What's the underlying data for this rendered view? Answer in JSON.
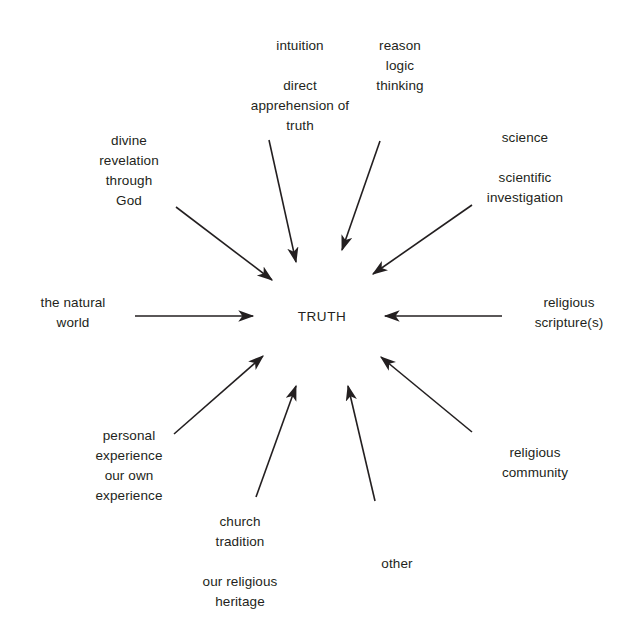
{
  "diagram": {
    "type": "radial-convergence",
    "title_visible": false,
    "center": {
      "label": "TRUTH",
      "x": 322,
      "y": 317
    },
    "background_color": "#ffffff",
    "line_color": "#231f20",
    "text_color": "#231f20",
    "nodes": [
      {
        "id": "intuition",
        "lines": [
          "intuition",
          "direct",
          "apprehension of",
          "truth"
        ],
        "text": "intuition\n\ndirect\napprehension of\ntruth",
        "align": "center",
        "x": 245,
        "y": 36,
        "width": 110,
        "arrow": {
          "x1": 269,
          "y1": 140,
          "x2": 296,
          "y2": 262
        }
      },
      {
        "id": "reason",
        "lines": [
          "reason",
          "logic",
          "thinking"
        ],
        "text": "reason\nlogic\nthinking",
        "align": "center",
        "x": 360,
        "y": 36,
        "width": 80,
        "arrow": {
          "x1": 380,
          "y1": 141,
          "x2": 342,
          "y2": 250
        }
      },
      {
        "id": "divine-revelation",
        "lines": [
          "divine",
          "revelation",
          "through",
          "God"
        ],
        "text": "divine\nrevelation\nthrough\nGod",
        "align": "center",
        "x": 80,
        "y": 131,
        "width": 98,
        "arrow": {
          "x1": 176,
          "y1": 207,
          "x2": 272,
          "y2": 280
        }
      },
      {
        "id": "science",
        "lines": [
          "science",
          "scientific",
          "investigation"
        ],
        "text": "science\n\nscientific\ninvestigation",
        "align": "center",
        "x": 470,
        "y": 128,
        "width": 110,
        "arrow": {
          "x1": 472,
          "y1": 205,
          "x2": 373,
          "y2": 274
        }
      },
      {
        "id": "natural-world",
        "lines": [
          "the natural",
          "world"
        ],
        "text": "the natural\nworld",
        "align": "center",
        "x": 23,
        "y": 293,
        "width": 100,
        "arrow": {
          "x1": 135,
          "y1": 316,
          "x2": 253,
          "y2": 316
        }
      },
      {
        "id": "religious-scriptures",
        "lines": [
          "religious",
          "scripture(s)"
        ],
        "text": "religious\nscripture(s)",
        "align": "center",
        "x": 519,
        "y": 293,
        "width": 100,
        "arrow": {
          "x1": 502,
          "y1": 316,
          "x2": 385,
          "y2": 316
        }
      },
      {
        "id": "personal-experience",
        "lines": [
          "personal",
          "experience",
          "our own",
          "experience"
        ],
        "text": "personal\nexperience\nour own\nexperience",
        "align": "center",
        "x": 74,
        "y": 426,
        "width": 110,
        "arrow": {
          "x1": 174,
          "y1": 434,
          "x2": 263,
          "y2": 356
        }
      },
      {
        "id": "religious-community",
        "lines": [
          "religious",
          "community"
        ],
        "text": "religious\ncommunity",
        "align": "center",
        "x": 480,
        "y": 443,
        "width": 110,
        "arrow": {
          "x1": 472,
          "y1": 432,
          "x2": 381,
          "y2": 357
        }
      },
      {
        "id": "church-tradition",
        "lines": [
          "church",
          "tradition",
          "our religious",
          "heritage"
        ],
        "text": "church\ntradition\n\nour religious\nheritage",
        "align": "center",
        "x": 180,
        "y": 512,
        "width": 120,
        "arrow": {
          "x1": 256,
          "y1": 497,
          "x2": 296,
          "y2": 386
        }
      },
      {
        "id": "other",
        "lines": [
          "other"
        ],
        "text": "other",
        "align": "center",
        "x": 357,
        "y": 554,
        "width": 80,
        "arrow": {
          "x1": 375,
          "y1": 501,
          "x2": 348,
          "y2": 386
        }
      }
    ]
  }
}
